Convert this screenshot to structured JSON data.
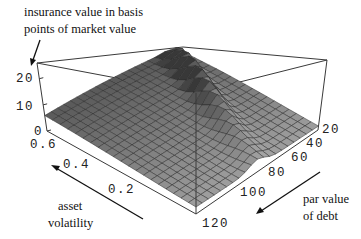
{
  "chart_data": {
    "type": "surface3d",
    "title": "",
    "zlabel": "insurance value in basis points of market value",
    "xlabel": "par value of debt",
    "ylabel": "asset volatility",
    "z_ticks": [
      "0",
      "10",
      "20"
    ],
    "x_ticks": [
      "20",
      "40",
      "60",
      "80",
      "100",
      "120"
    ],
    "y_ticks": [
      "0.6",
      "0.4",
      "0.2"
    ],
    "xlim": [
      10,
      120
    ],
    "ylim": [
      0.05,
      0.7
    ],
    "zlim": [
      0,
      26
    ],
    "grid": {
      "nx": 20,
      "ny": 20
    }
  },
  "labels": {
    "z_line1": "insurance value in basis",
    "z_line2": "points of market value",
    "y_line1": "asset",
    "y_line2": "volatility",
    "x_line1": "par value",
    "x_line2": "of debt"
  },
  "colors": {
    "box": "#3a3a3a",
    "mesh_line": "#2a2a2a",
    "surface_light": "#d8d8d8",
    "surface_dark": "#3c3c3c"
  }
}
